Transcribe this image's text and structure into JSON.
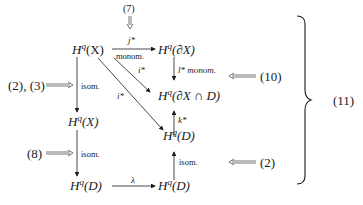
{
  "diagram": {
    "equation_number": "(11)",
    "nodes": {
      "HqX": "H",
      "HqX_sup": "q",
      "HqX_arg": "(X)",
      "HqdX": "H",
      "HqdX_sup": "q",
      "HqdX_arg": "(∂X)",
      "HqdXD": "H",
      "HqdXD_sup": "q",
      "HqdXD_arg": "(∂X ∩ D)",
      "HqD": "H",
      "HqD_sup": "q",
      "HqD_arg": "(D)",
      "HqhX": "H",
      "HqhX_sup": "q",
      "HqhX_sub": "h",
      "HqhX_arg": "(X)",
      "HqhD": "H",
      "HqhD_sup": "q",
      "HqhD_sub": "h",
      "HqhD_arg": "(D)",
      "HqdD": "H",
      "HqdD_sup": "q",
      "HqdD_sub": "d",
      "HqdD_arg": "(D)"
    },
    "arrow_labels": {
      "j_star": "j*",
      "monom_top": "monom.",
      "l_star": "l* monom.",
      "i_tilde_star": "i*",
      "i_star": "i*",
      "k_star": "k*",
      "isom_left_top": "isom.",
      "isom_left_bottom": "isom.",
      "isom_right": "isom.",
      "lambda": "λ"
    },
    "references": {
      "top": "(7)",
      "left_upper": "(2), (3)",
      "left_lower": "(8)",
      "right_upper": "(10)",
      "right_lower": "(2)"
    }
  }
}
